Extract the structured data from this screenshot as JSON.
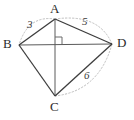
{
  "figure": {
    "kind": "geometry-diagram",
    "colors": {
      "edge": "#3d3d3d",
      "diagonal": "#555555",
      "arc": "#b8b8b8",
      "label": "#2b2b2b",
      "background": "#ffffff"
    },
    "vertices": [
      {
        "id": "A",
        "label": "A",
        "x": 55,
        "y": 19,
        "label_x": 50,
        "label_y": 2
      },
      {
        "id": "B",
        "label": "B",
        "x": 19,
        "y": 45,
        "label_x": 3,
        "label_y": 39
      },
      {
        "id": "C",
        "label": "C",
        "x": 55,
        "y": 96,
        "label_x": 50,
        "label_y": 101
      },
      {
        "id": "D",
        "label": "D",
        "x": 112,
        "y": 44,
        "label_x": 117,
        "label_y": 38
      }
    ],
    "edges": [
      {
        "id": "AB",
        "from": "A",
        "to": "B",
        "style": "solid",
        "length_label": "3"
      },
      {
        "id": "BC",
        "from": "B",
        "to": "C",
        "style": "solid",
        "length_label": ""
      },
      {
        "id": "CD",
        "from": "C",
        "to": "D",
        "style": "solid",
        "length_label": "6"
      },
      {
        "id": "DA",
        "from": "D",
        "to": "A",
        "style": "solid",
        "length_label": "5"
      }
    ],
    "diagonals": [
      {
        "id": "AC",
        "from": "A",
        "to": "C",
        "style": "solid"
      },
      {
        "id": "BD",
        "from": "B",
        "to": "D",
        "style": "solid"
      }
    ],
    "arcs": [
      {
        "id": "arc-AB",
        "on_edge": "AB",
        "style": "dotted"
      },
      {
        "id": "arc-AD",
        "on_edge": "DA",
        "style": "dotted"
      },
      {
        "id": "arc-CD",
        "on_edge": "CD",
        "style": "dotted"
      }
    ],
    "right_angle": {
      "at": "diagonal-intersection",
      "x": 55,
      "y": 44,
      "size": 7,
      "quadrant": "upper-right"
    },
    "length_labels": [
      {
        "id": "label-3",
        "text": "3",
        "edge": "AB",
        "x": 27,
        "y": 20
      },
      {
        "id": "label-5",
        "text": "5",
        "edge": "DA",
        "x": 82,
        "y": 17
      },
      {
        "id": "label-6",
        "text": "6",
        "edge": "CD",
        "x": 84,
        "y": 71
      }
    ]
  }
}
